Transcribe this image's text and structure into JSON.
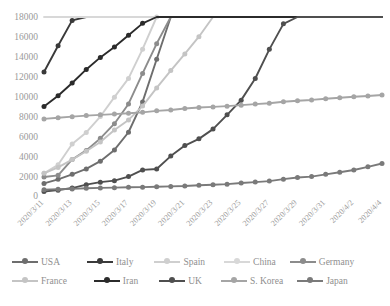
{
  "chart_data": {
    "type": "line",
    "title": "",
    "xlabel": "",
    "ylabel": "",
    "ylim": [
      0,
      18000
    ],
    "ytick_step": 2000,
    "yticks": [
      "0",
      "2000",
      "4000",
      "6000",
      "8000",
      "10000",
      "12000",
      "14000",
      "16000",
      "18000"
    ],
    "grid": false,
    "legend_position": "bottom",
    "x": [
      "2020/3/11",
      "2020/3/12",
      "2020/3/13",
      "2020/3/14",
      "2020/3/15",
      "2020/3/16",
      "2020/3/17",
      "2020/3/18",
      "2020/3/19",
      "2020/3/20",
      "2020/3/21",
      "2020/3/22",
      "2020/3/23",
      "2020/3/24",
      "2020/3/25",
      "2020/3/26",
      "2020/3/27",
      "2020/3/28",
      "2020/3/29",
      "2020/3/30",
      "2020/3/31",
      "2020/4/1",
      "2020/4/2",
      "2020/4/3",
      "2020/4/4"
    ],
    "xtick_labels": [
      "2020/3/11",
      "2020/3/13",
      "2020/3/15",
      "2020/3/17",
      "2020/3/19",
      "2020/3/21",
      "2020/3/23",
      "2020/3/25",
      "2020/3/27",
      "2020/3/29",
      "2020/3/31",
      "2020/4/2",
      "2020/4/4"
    ],
    "series": [
      {
        "name": "USA",
        "color": "#6e6e6e",
        "values": [
          1264,
          1678,
          2179,
          2726,
          3499,
          4632,
          6411,
          9464,
          13759,
          19273,
          25600,
          33746,
          43847,
          54935,
          68211,
          85612,
          104126,
          123750,
          143532,
          164620,
          188172,
          213372,
          243762,
          275586,
          308850
        ]
      },
      {
        "name": "Italy",
        "color": "#3a3a3a",
        "values": [
          12462,
          15113,
          17660,
          21157,
          24747,
          27980,
          31506,
          35713,
          41035,
          47021,
          53578,
          59138,
          63927,
          69176,
          74386,
          80589,
          86498,
          92472,
          97689,
          101739,
          105792,
          110574,
          115242,
          119827,
          124632
        ]
      },
      {
        "name": "Spain",
        "color": "#cfcfcf",
        "values": [
          2277,
          3146,
          5232,
          6391,
          7988,
          9942,
          11826,
          14769,
          18077,
          21571,
          25374,
          28768,
          35136,
          42058,
          49515,
          57786,
          65719,
          73235,
          80110,
          87956,
          95923,
          104118,
          112065,
          119199,
          126168
        ]
      },
      {
        "name": "China",
        "color": "#d8d8d8",
        "values": [
          80955,
          80921,
          80967,
          80991,
          81033,
          81058,
          81102,
          81156,
          81250,
          81305,
          81435,
          81498,
          81601,
          81661,
          81782,
          81897,
          81999,
          82122,
          82198,
          82279,
          82361,
          82432,
          82511,
          82575,
          82641
        ]
      },
      {
        "name": "Germany",
        "color": "#8c8c8c",
        "values": [
          1908,
          2078,
          3675,
          4585,
          5795,
          7272,
          9257,
          12327,
          15320,
          19848,
          22213,
          24873,
          29056,
          32986,
          37323,
          43938,
          50871,
          57695,
          62095,
          66885,
          71808,
          77872,
          84794,
          91159,
          96092
        ]
      },
      {
        "name": "France",
        "color": "#c4c4c4",
        "values": [
          2281,
          2876,
          3661,
          4499,
          5423,
          6633,
          7652,
          9043,
          10871,
          12612,
          14282,
          16018,
          19856,
          22304,
          25233,
          29155,
          32964,
          37575,
          40174,
          44550,
          52128,
          56989,
          59105,
          64338,
          68605
        ]
      },
      {
        "name": "Iran",
        "color": "#2b2b2b",
        "values": [
          9000,
          10075,
          11364,
          12729,
          13938,
          14991,
          16169,
          17361,
          18407,
          19644,
          20610,
          21638,
          23049,
          24811,
          27017,
          29406,
          32332,
          35408,
          38309,
          41495,
          44605,
          47593,
          50468,
          53183,
          55743
        ]
      },
      {
        "name": "UK",
        "color": "#4f4f4f",
        "values": [
          456,
          590,
          798,
          1140,
          1391,
          1543,
          1950,
          2626,
          2716,
          4014,
          5067,
          5745,
          6726,
          8164,
          9640,
          11812,
          14745,
          17312,
          19780,
          22453,
          25481,
          29865,
          34173,
          38689,
          42477
        ]
      },
      {
        "name": "S. Korea",
        "color": "#a5a5a5",
        "values": [
          7755,
          7869,
          7979,
          8086,
          8162,
          8236,
          8320,
          8413,
          8565,
          8652,
          8799,
          8897,
          8961,
          9037,
          9137,
          9241,
          9332,
          9478,
          9583,
          9661,
          9786,
          9887,
          9976,
          10062,
          10156
        ]
      },
      {
        "name": "Japan",
        "color": "#7a7a7a",
        "values": [
          639,
          675,
          716,
          780,
          814,
          839,
          878,
          889,
          924,
          963,
          1007,
          1086,
          1128,
          1193,
          1307,
          1399,
          1499,
          1693,
          1866,
          1953,
          2178,
          2384,
          2617,
          2935,
          3271
        ]
      }
    ]
  },
  "legend": {
    "rows": [
      [
        {
          "label": "USA",
          "color": "#6e6e6e"
        },
        {
          "label": "Italy",
          "color": "#3a3a3a"
        },
        {
          "label": "Spain",
          "color": "#cfcfcf"
        },
        {
          "label": "China",
          "color": "#d8d8d8"
        },
        {
          "label": "Germany",
          "color": "#8c8c8c"
        }
      ],
      [
        {
          "label": "France",
          "color": "#c4c4c4"
        },
        {
          "label": "Iran",
          "color": "#2b2b2b"
        },
        {
          "label": "UK",
          "color": "#4f4f4f"
        },
        {
          "label": "S. Korea",
          "color": "#a5a5a5"
        },
        {
          "label": "Japan",
          "color": "#7a7a7a"
        }
      ]
    ]
  }
}
